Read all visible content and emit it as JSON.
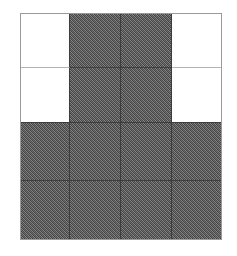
{
  "figure": {
    "title": "",
    "type": "grid-pattern",
    "canvas": {
      "width": 237,
      "height": 256,
      "background": "#ffffff"
    },
    "grid": {
      "left": 20,
      "top": 13,
      "width": 202,
      "height": 227,
      "rows": 4,
      "columns": 4,
      "column_widths": [
        50,
        51,
        51,
        50
      ],
      "row_heights": [
        55,
        55,
        58,
        59
      ],
      "border_color": "#9a9a9a",
      "line_color_dark": "#3c3c3c",
      "line_color_light": "#b4b4b4",
      "fill_color_gray": "#6e6e6e",
      "fill_color_white": "#ffffff",
      "fill_legend": {
        "gray": "filled",
        "white": "empty"
      },
      "cells": [
        [
          {
            "fill": "white",
            "label": "r1c1"
          },
          {
            "fill": "gray",
            "label": "r1c2"
          },
          {
            "fill": "gray",
            "label": "r1c3"
          },
          {
            "fill": "white",
            "label": "r1c4"
          }
        ],
        [
          {
            "fill": "white",
            "label": "r2c1"
          },
          {
            "fill": "gray",
            "label": "r2c2"
          },
          {
            "fill": "gray",
            "label": "r2c3"
          },
          {
            "fill": "white",
            "label": "r2c4"
          }
        ],
        [
          {
            "fill": "gray",
            "label": "r3c1"
          },
          {
            "fill": "gray",
            "label": "r3c2"
          },
          {
            "fill": "gray",
            "label": "r3c3"
          },
          {
            "fill": "gray",
            "label": "r3c4"
          }
        ],
        [
          {
            "fill": "gray",
            "label": "r4c1"
          },
          {
            "fill": "gray",
            "label": "r4c2"
          },
          {
            "fill": "gray",
            "label": "r4c3"
          },
          {
            "fill": "gray",
            "label": "r4c4"
          }
        ]
      ]
    }
  }
}
